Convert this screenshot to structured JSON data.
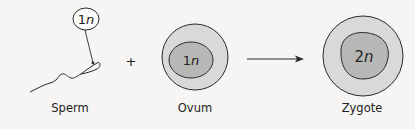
{
  "diagram": {
    "cells": [
      {
        "id": "sperm",
        "label": "Sperm",
        "ploidy_num": "1",
        "ploidy_var": "n"
      },
      {
        "id": "ovum",
        "label": "Ovum",
        "ploidy_num": "1",
        "ploidy_var": "n"
      },
      {
        "id": "zygote",
        "label": "Zygote",
        "ploidy_num": "2",
        "ploidy_var": "n"
      }
    ],
    "operator": "+",
    "colors": {
      "background": "#f6f5f3",
      "cytoplasm": "#d9d9d7",
      "nucleus": "#b7b7b5",
      "stroke": "#2a2a2a"
    }
  }
}
